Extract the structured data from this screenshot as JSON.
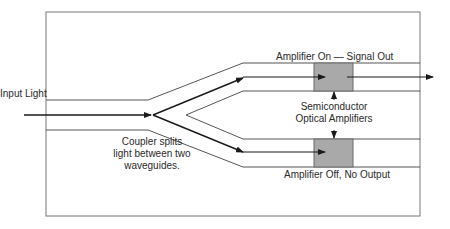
{
  "diagram": {
    "type": "optical-switch-schematic",
    "labels": {
      "input": "Input Light",
      "top_output": "Amplifier On — Signal Out",
      "amplifiers_line1": "Semiconductor",
      "amplifiers_line2": "Optical Amplifiers",
      "bottom_output": "Amplifier Off, No Output",
      "coupler_line1": "Coupler splits",
      "coupler_line2": "light between two",
      "coupler_line3": "waveguides."
    },
    "colors": {
      "frame": "#777777",
      "waveguide_edge": "#555555",
      "beam": "#1a1a1a",
      "amplifier_fill": "#a9a9a9",
      "amplifier_stroke": "#6a6a6a",
      "text": "#2a2a2a"
    },
    "components": [
      {
        "name": "input-waveguide",
        "kind": "waveguide"
      },
      {
        "name": "y-coupler",
        "kind": "coupler"
      },
      {
        "name": "upper-branch",
        "kind": "waveguide",
        "state": "amplifier on"
      },
      {
        "name": "lower-branch",
        "kind": "waveguide",
        "state": "amplifier off"
      },
      {
        "name": "upper-soa",
        "kind": "semiconductor optical amplifier"
      },
      {
        "name": "lower-soa",
        "kind": "semiconductor optical amplifier"
      }
    ]
  }
}
